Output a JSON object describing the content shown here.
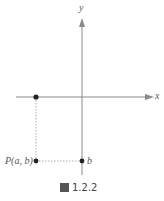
{
  "diagram": {
    "axes": {
      "x_label": "x",
      "y_label": "y"
    },
    "points": [
      {
        "name": "point-on-x-axis",
        "label": ""
      },
      {
        "name": "point-P",
        "label": "P(a, b)"
      },
      {
        "name": "point-b",
        "label": "b"
      }
    ],
    "caption": {
      "prefix": "圖",
      "number": "1.2.2"
    },
    "colors": {
      "axis": "#8a8a8a",
      "point": "#222222",
      "dash": "#999999"
    }
  }
}
